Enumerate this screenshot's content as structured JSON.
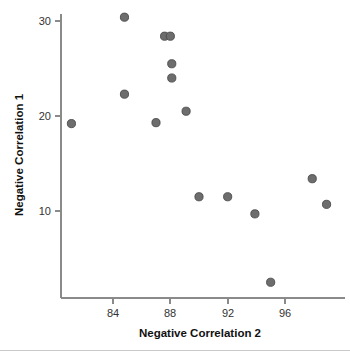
{
  "chart_data": {
    "type": "scatter",
    "title": "",
    "xlabel": "Negative Correlation 2",
    "ylabel": "Negative Correlation 1",
    "xlim": [
      80.4,
      99.6
    ],
    "ylim": [
      1.3,
      31.4
    ],
    "xticks": [
      84,
      88,
      92,
      96
    ],
    "xtick_labels": [
      "84",
      "88",
      "92",
      "96"
    ],
    "yticks": [
      10,
      20,
      30
    ],
    "ytick_labels": [
      "10",
      "20",
      "30"
    ],
    "grid": false,
    "legend": false,
    "marker": "circle",
    "marker_color": "#6d6d6d",
    "marker_edge_color": "#4a4a4a",
    "points": [
      {
        "x": 81.1,
        "y": 19.2
      },
      {
        "x": 84.8,
        "y": 30.4
      },
      {
        "x": 84.8,
        "y": 22.3
      },
      {
        "x": 87.6,
        "y": 28.4
      },
      {
        "x": 88.0,
        "y": 28.4
      },
      {
        "x": 88.1,
        "y": 25.5
      },
      {
        "x": 88.1,
        "y": 24.0
      },
      {
        "x": 87.0,
        "y": 19.3
      },
      {
        "x": 89.1,
        "y": 20.5
      },
      {
        "x": 90.0,
        "y": 11.5
      },
      {
        "x": 92.0,
        "y": 11.5
      },
      {
        "x": 93.9,
        "y": 9.7
      },
      {
        "x": 95.0,
        "y": 2.5
      },
      {
        "x": 97.9,
        "y": 13.4
      },
      {
        "x": 98.9,
        "y": 10.7
      }
    ]
  }
}
